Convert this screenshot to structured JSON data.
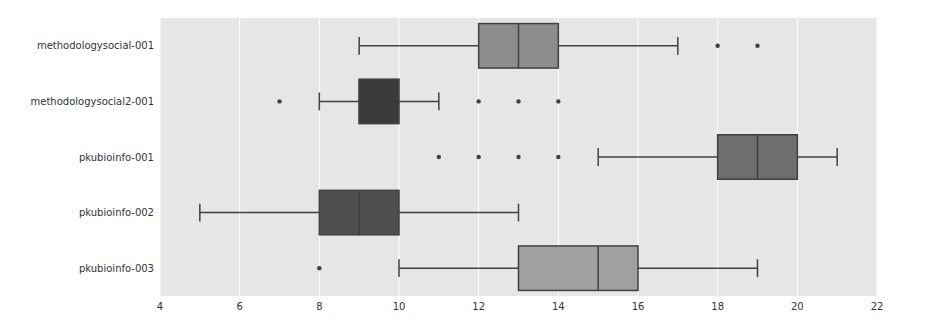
{
  "chart_data": {
    "type": "boxplot",
    "orientation": "horizontal",
    "title": "",
    "xlabel": "",
    "ylabel": "",
    "xlim": [
      4,
      22
    ],
    "xticks": [
      4,
      6,
      8,
      10,
      12,
      14,
      16,
      18,
      20,
      22
    ],
    "grid": true,
    "legend": null,
    "categories": [
      "methodologysocial-001",
      "methodologysocial2-001",
      "pkubioinfo-001",
      "pkubioinfo-002",
      "pkubioinfo-003"
    ],
    "series": [
      {
        "name": "methodologysocial-001",
        "whisker_low": 9,
        "q1": 12,
        "median": 13,
        "q3": 14,
        "whisker_high": 17,
        "outliers": [
          18,
          19
        ],
        "color": "#8c8c8c"
      },
      {
        "name": "methodologysocial2-001",
        "whisker_low": 8,
        "q1": 9,
        "median": 9,
        "q3": 10,
        "whisker_high": 11,
        "outliers": [
          7,
          12,
          13,
          14
        ],
        "color": "#3a3a3a"
      },
      {
        "name": "pkubioinfo-001",
        "whisker_low": 15,
        "q1": 18,
        "median": 19,
        "q3": 20,
        "whisker_high": 21,
        "outliers": [
          11,
          12,
          13,
          14
        ],
        "color": "#6e6e6e"
      },
      {
        "name": "pkubioinfo-002",
        "whisker_low": 5,
        "q1": 8,
        "median": 9,
        "q3": 10,
        "whisker_high": 13,
        "outliers": [],
        "color": "#4f4f4f"
      },
      {
        "name": "pkubioinfo-003",
        "whisker_low": 10,
        "q1": 13,
        "median": 15,
        "q3": 16,
        "whisker_high": 19,
        "outliers": [
          8
        ],
        "color": "#a0a0a0"
      }
    ]
  },
  "style": {
    "plot_background": "#e6e6e6",
    "grid_color": "#ffffff",
    "line_color": "#404040"
  }
}
